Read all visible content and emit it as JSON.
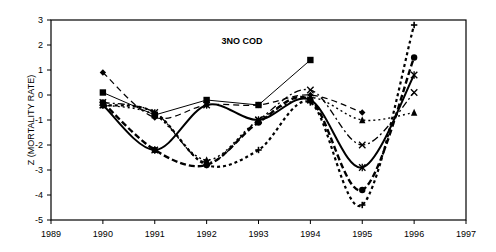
{
  "chart_data": {
    "type": "line",
    "title": "3NO COD",
    "xlabel": "",
    "ylabel": "Z (MORTALITY RATE)",
    "xlim": [
      1989,
      1997
    ],
    "ylim": [
      -5,
      3
    ],
    "x_ticks": [
      "1989",
      "1990",
      "1991",
      "1992",
      "1993",
      "1994",
      "1995",
      "1996",
      "1997"
    ],
    "y_ticks": [
      "3",
      "2",
      "1",
      "0",
      "-1",
      "-2",
      "-3",
      "-4",
      "-5"
    ],
    "grid": false,
    "legend": null,
    "x": [
      1990,
      1991,
      1992,
      1993,
      1994,
      1995,
      1996
    ],
    "series": [
      {
        "name": "diamond (dashed)",
        "marker": "diamond",
        "values": [
          0.9,
          -0.9,
          -0.4,
          -0.4,
          0.0,
          -0.7,
          null
        ]
      },
      {
        "name": "square (thin solid)",
        "marker": "square",
        "values": [
          0.1,
          -0.8,
          -0.2,
          -0.4,
          1.4,
          null,
          null
        ]
      },
      {
        "name": "triangle (dotted)",
        "marker": "triangle",
        "values": [
          -0.4,
          -0.8,
          -2.6,
          -1.0,
          -0.1,
          -1.0,
          -0.7
        ]
      },
      {
        "name": "x (dash-dot)",
        "marker": "x",
        "values": [
          -0.3,
          -0.7,
          -2.7,
          -1.0,
          0.2,
          -2.0,
          0.1
        ]
      },
      {
        "name": "star (solid thick)",
        "marker": "asterisk",
        "values": [
          -0.4,
          -2.2,
          -0.4,
          -1.0,
          -0.2,
          -2.9,
          0.8
        ]
      },
      {
        "name": "circle (thick dashed)",
        "marker": "circle",
        "values": [
          -0.3,
          -2.2,
          -2.8,
          -1.1,
          -0.2,
          -3.8,
          1.5
        ]
      },
      {
        "name": "plus (dotted)",
        "marker": "plus",
        "values": [
          -0.4,
          -0.7,
          -2.8,
          -2.2,
          -0.3,
          -4.4,
          2.8
        ]
      }
    ]
  }
}
